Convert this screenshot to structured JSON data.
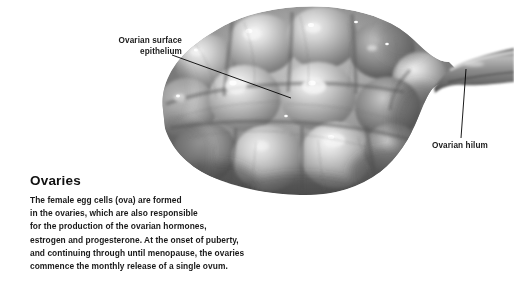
{
  "figure": {
    "background_color": "#ffffff"
  },
  "illustration": {
    "name": "ovary-specimen-image",
    "description": "Grayscale photographic illustration of a lumpy ovary with a protruding hilum stalk at the right",
    "palette": {
      "highlight": "#e8e8e8",
      "midtone": "#9a9a9a",
      "shadow": "#4a4a4a",
      "deep_shadow": "#2e2e2e"
    }
  },
  "callouts": [
    {
      "id": "ovarian-surface-epithelium",
      "label": "Ovarian surface\nepithelium",
      "leader": {
        "x1": 172,
        "y1": 55,
        "x2": 291,
        "y2": 98
      }
    },
    {
      "id": "ovarian-hilum",
      "label": "Ovarian hilum",
      "leader": {
        "x1": 466,
        "y1": 69,
        "x2": 461,
        "y2": 138
      }
    }
  ],
  "caption": {
    "title": "Ovaries",
    "body": "The female egg cells (ova) are formed\nin the ovaries, which are also responsible\nfor the production of the ovarian hormones,\nestrogen and progesterone. At the onset of puberty,\nand continuing through until menopause, the ovaries\ncommence the monthly release of a single ovum."
  },
  "colors": {
    "text": "#1a1a1a",
    "title": "#111111",
    "leader_line": "#000000"
  }
}
